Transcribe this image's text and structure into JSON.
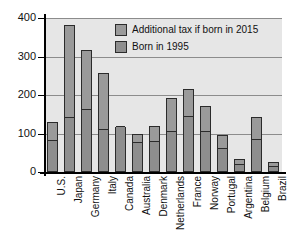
{
  "chart_data": {
    "type": "bar",
    "subtype": "stacked-bar",
    "title": "",
    "subtitle": "",
    "xlabel": "",
    "ylabel": "",
    "ylim": [
      0,
      400
    ],
    "yticks": [
      0,
      100,
      200,
      300,
      400
    ],
    "ytick_labels": [
      "0",
      "100",
      "200",
      "300",
      "400"
    ],
    "grid": true,
    "grid_orientation": "horizontal",
    "legend_position": "top-right-inside",
    "categories": [
      "U.S.",
      "Japan",
      "Germany",
      "Italy",
      "Canada",
      "Australia",
      "Denmark",
      "Netherlands",
      "France",
      "Norway",
      "Portugal",
      "Argentina",
      "Belgium",
      "Brazil"
    ],
    "series": [
      {
        "name": "Born in 1995",
        "color": "#8e8e8e",
        "values": [
          80,
          140,
          160,
          108,
          117,
          75,
          78,
          105,
          142,
          105,
          60,
          18,
          84,
          12
        ]
      },
      {
        "name": "Additional tax if born in 2015",
        "color": "#9a9a9a",
        "values": [
          50,
          241,
          157,
          150,
          0,
          25,
          42,
          88,
          73,
          67,
          35,
          17,
          60,
          13
        ]
      }
    ],
    "totals": [
      130,
      381,
      317,
      258,
      117,
      100,
      120,
      193,
      215,
      172,
      95,
      35,
      144,
      25
    ]
  },
  "legend": {
    "entries": [
      {
        "label": "Additional tax if born in 2015",
        "swatch": "legend-swatch-upper"
      },
      {
        "label": "Born in 1995",
        "swatch": "legend-swatch-lower"
      }
    ]
  },
  "colors": {
    "plot_background": "#e6e6e6",
    "page_background": "#ffffff",
    "bar_upper": "#9a9a9a",
    "bar_lower": "#8e8e8e",
    "bar_outline": "#2b2b2b",
    "gridline": "#8c8c8c",
    "axis": "#000000",
    "text": "#111111"
  }
}
